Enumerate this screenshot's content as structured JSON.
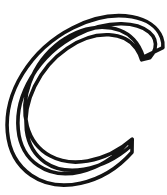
{
  "canvas": {
    "width": 167,
    "height": 195,
    "background_color": "#ffffff"
  },
  "artwork": {
    "name": "letter-c-outline",
    "character": "C",
    "script": "Latin",
    "case": "uppercase",
    "style": "decorative-calligraphic-outline",
    "fill_color": "#ffffff",
    "stroke_color": "#131313",
    "stroke_width": 3.6,
    "is_hollow_outline": true,
    "glyph_bounds": {
      "left": 13,
      "top": 10,
      "right": 163,
      "bottom": 185
    },
    "features": [
      {
        "name": "top-right-beak-terminal",
        "description": "curled hook terminal pointing down-left",
        "tip": [
          143,
          57
        ]
      },
      {
        "name": "left-spine",
        "description": "thickest modulated stroke along left side",
        "max_thickness": 18
      },
      {
        "name": "bottom-right-tapered-terminal",
        "description": "sharp point sweeping upward to the right",
        "tip": [
          132,
          152
        ]
      }
    ],
    "outline_path": "M 143.5 57.2 C 141.2 50.0 138.0 44.0 133.6 39.4 C 126.0 31.4 115.0 27.2 102.0 27.2 C 88.0 27.2 73.2 32.4 60.4 41.8 C 46.6 52.0 35.8 66.4 29.8 82.6 C 24.4 97.2 23.4 112.6 27.2 126.2 C 30.8 139.2 38.8 149.6 50.0 155.8 C 60.6 161.6 73.8 163.4 87.6 161.0 C 103.6 158.2 119.6 150.4 132.2 139.2 L 132.0 152.2 C 118.2 167.8 99.8 179.0 80.6 183.2 C 62.2 187.2 44.6 184.4 31.2 175.2 C 17.6 165.8 9.0 150.4 7.4 132.0 C 5.8 113.0 11.2 92.0 22.6 73.6 C 34.6 54.2 52.6 38.0 72.8 27.8 C 93.0 17.6 114.2 13.6 132.0 16.8 C 146.8 19.4 157.6 27.0 161.6 37.6 C 162.8 40.8 163.2 44.2 162.9 47.6 Z M 149.8 57.8 C 152.4 55.0 154.2 51.8 155.0 48.4 C 156.4 42.4 154.4 36.6 149.2 32.2 C 143.0 27.0 133.2 24.0 121.6 23.8 C 107.4 23.6 91.6 27.6 77.0 35.0 C 58.4 44.4 42.2 59.4 31.6 77.0 C 21.4 93.8 16.6 112.6 18.2 129.4 C 19.6 145.0 26.8 157.8 38.2 165.6 C 49.6 173.4 64.6 175.6 80.2 172.0 C 97.6 168.0 115.2 157.2 128.0 142.4 L 130.8 146.0 C 117.0 158.2 100.2 166.4 84.0 169.2 C 69.0 171.8 55.4 169.4 45.2 162.4 C 34.8 155.2 28.2 143.8 26.4 130.0 C 24.6 116.2 27.6 100.8 34.6 86.4 C 42.0 71.0 53.6 57.6 67.0 48.4 C 80.6 39.0 95.6 34.2 109.0 34.8 C 120.8 35.4 130.4 40.2 136.2 48.4 C 138.6 51.8 140.4 55.6 141.6 59.8 Z"
  }
}
